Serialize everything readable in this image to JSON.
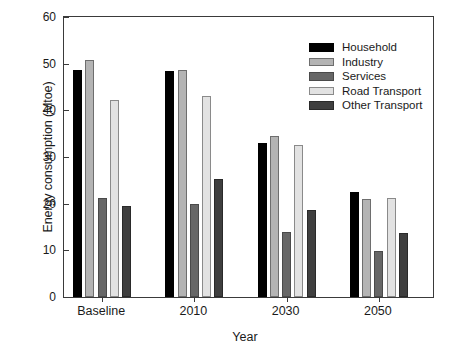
{
  "chart_data": {
    "type": "bar",
    "title": "",
    "xlabel": "Year",
    "ylabel": "Energy consumption (Mtoe)",
    "categories": [
      "Baseline",
      "2010",
      "2030",
      "2050"
    ],
    "ylim": [
      0,
      60
    ],
    "yticks": [
      0,
      10,
      20,
      30,
      40,
      50,
      60
    ],
    "ytick_labels": [
      "0",
      "10",
      "20",
      "30",
      "40",
      "50",
      "60"
    ],
    "grid": false,
    "legend_position": "top-right",
    "series": [
      {
        "name": "Household",
        "color": "#000000",
        "values": [
          48.7,
          48.4,
          33.1,
          22.4
        ]
      },
      {
        "name": "Industry",
        "color": "#b4b4b4",
        "values": [
          50.7,
          48.7,
          34.4,
          21.0
        ]
      },
      {
        "name": "Services",
        "color": "#676767",
        "values": [
          21.2,
          20.0,
          14.0,
          9.8
        ]
      },
      {
        "name": "Road Transport",
        "color": "#e2e2e2",
        "values": [
          42.2,
          43.0,
          32.5,
          21.2
        ]
      },
      {
        "name": "Other Transport",
        "color": "#3f3f3f",
        "values": [
          19.4,
          25.3,
          18.7,
          13.7
        ]
      }
    ]
  }
}
